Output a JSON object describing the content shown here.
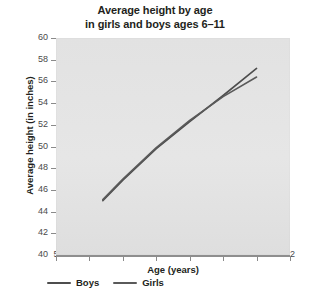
{
  "chart_data": {
    "type": "line",
    "title": "Average height by age in girls and boys ages 6–11",
    "title_line1": "Average height by age",
    "title_line2": "in girls and boys ages 6–11",
    "xlabel": "Age (years)",
    "ylabel": "Average height (in inches)",
    "xlim": [
      5,
      12
    ],
    "ylim": [
      40,
      60
    ],
    "xticks": [
      5,
      6,
      7,
      8,
      9,
      10,
      11,
      12
    ],
    "xtick_labels": [
      "5",
      "6",
      "7",
      "8",
      "9",
      "10",
      "11",
      "12"
    ],
    "yticks": [
      40,
      42,
      44,
      46,
      48,
      50,
      52,
      54,
      56,
      58,
      60
    ],
    "ytick_labels": [
      "40",
      "42",
      "44",
      "46",
      "48",
      "50",
      "52",
      "54",
      "56",
      "58",
      "60"
    ],
    "grid": false,
    "legend_position": "below-axes-left",
    "plot_background_color": "#e3e3e3",
    "series": [
      {
        "name": "Boys",
        "color": "#4d4d4d",
        "x": [
          6.4,
          7,
          8,
          9,
          10,
          11
        ],
        "values": [
          45.0,
          46.9,
          49.8,
          52.3,
          54.7,
          57.2
        ]
      },
      {
        "name": "Girls",
        "color": "#5a5a5a",
        "x": [
          6.4,
          7,
          8,
          9,
          10,
          11
        ],
        "values": [
          45.1,
          47.0,
          49.9,
          52.4,
          54.6,
          56.4
        ]
      }
    ]
  },
  "legend": {
    "entries": [
      {
        "label": "Boys",
        "color": "#4d4d4d"
      },
      {
        "label": "Girls",
        "color": "#5a5a5a"
      }
    ]
  }
}
